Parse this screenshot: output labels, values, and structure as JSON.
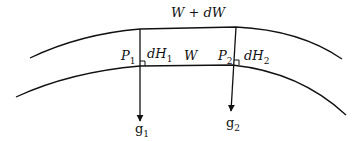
{
  "diagram": {
    "surfaces": {
      "upper": {
        "label": "W + dW"
      },
      "lower": {
        "label": "W"
      }
    },
    "points": [
      {
        "id": "P1",
        "label": "P",
        "subscript": "1",
        "separation_label": "dH",
        "separation_subscript": "1",
        "gravity_label": "g",
        "gravity_subscript": "1"
      },
      {
        "id": "P2",
        "label": "P",
        "subscript": "2",
        "separation_label": "dH",
        "separation_subscript": "2",
        "gravity_label": "g",
        "gravity_subscript": "2"
      }
    ],
    "colors": {
      "line": "#111111",
      "background": "#ffffff"
    }
  }
}
